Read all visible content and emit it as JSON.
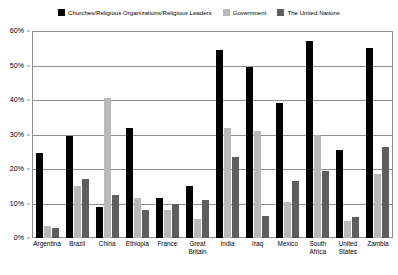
{
  "chart_data": {
    "type": "bar",
    "title": "",
    "subtitle": "",
    "xlabel": "",
    "ylabel": "",
    "ylim": [
      0,
      60
    ],
    "y_ticks": [
      "0%",
      "10%",
      "20%",
      "30%",
      "40%",
      "50%",
      "60%"
    ],
    "y_tick_values": [
      0,
      10,
      20,
      30,
      40,
      50,
      60
    ],
    "grid": true,
    "legend_position": "top-center",
    "categories": [
      "Argentina",
      "Brazil",
      "China",
      "Ethiopia",
      "France",
      "Great Britain",
      "India",
      "Iraq",
      "Mexico",
      "South Africa",
      "United States",
      "Zambia"
    ],
    "series": [
      {
        "name": "Churches/Religious Organizations/Religious Leaders",
        "color": "#000000",
        "values": [
          24.5,
          29.5,
          9,
          32,
          11.5,
          15,
          54.5,
          49.5,
          39,
          57,
          25.5,
          55
        ]
      },
      {
        "name": "Government",
        "color": "#b9b9b9",
        "values": [
          3.5,
          15,
          40.5,
          11.5,
          8,
          5.5,
          32,
          31,
          10.5,
          30,
          5,
          18.5
        ]
      },
      {
        "name": "The United Nations",
        "color": "#5e5e5e",
        "values": [
          3,
          17,
          12.5,
          8,
          10,
          11,
          23.5,
          6.5,
          16.5,
          19.5,
          6,
          26.5
        ]
      }
    ]
  }
}
